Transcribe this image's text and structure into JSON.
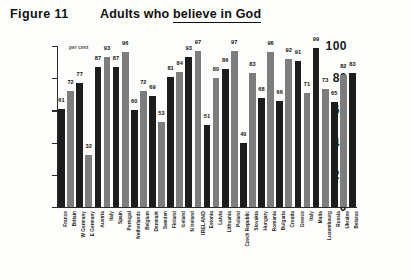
{
  "header": {
    "figure_label": "Figure 11",
    "title_prefix": "Adults who ",
    "title_underlined": "believe in God"
  },
  "axis": {
    "unit_note": "per cent",
    "y_ticks": [
      "0",
      "20",
      "40",
      "60",
      "80",
      "100"
    ]
  },
  "chart_data": {
    "type": "bar",
    "title": "Adults who believe in God",
    "xlabel": "",
    "ylabel": "per cent",
    "ylim": [
      0,
      100
    ],
    "grid": false,
    "legend": null,
    "categories": [
      "France",
      "Britain",
      "W Germany",
      "E Germany",
      "Austria",
      "Italy",
      "Spain",
      "Portugal",
      "Netherlands",
      "Belgium",
      "Denmark",
      "Sweden",
      "Finland",
      "Iceland",
      "N Ireland",
      "IRELAND",
      "Estonia",
      "Latvia",
      "Lithuania",
      "Poland",
      "Czech Republic",
      "Slovakia",
      "Hungary",
      "Romania",
      "Bulgaria",
      "Croatia",
      "Greece",
      "Italy",
      "Malta",
      "Luxembourg",
      "Russia",
      "Ukraine",
      "Belarus"
    ],
    "values": [
      61,
      72,
      77,
      32,
      87,
      93,
      87,
      96,
      60,
      72,
      69,
      53,
      81,
      84,
      93,
      97,
      51,
      80,
      86,
      97,
      40,
      83,
      68,
      96,
      66,
      92,
      91,
      71,
      99,
      73,
      65,
      82,
      83
    ]
  }
}
